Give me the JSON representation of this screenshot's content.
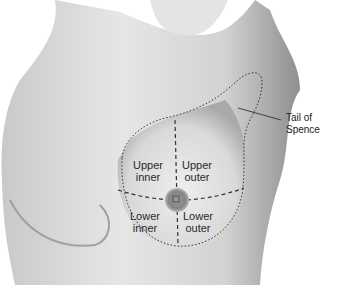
{
  "diagram": {
    "quadrants": [
      {
        "id": "upper-inner",
        "line1": "Upper",
        "line2": "inner"
      },
      {
        "id": "upper-outer",
        "line1": "Upper",
        "line2": "outer"
      },
      {
        "id": "lower-inner",
        "line1": "Lower",
        "line2": "inner"
      },
      {
        "id": "lower-outer",
        "line1": "Lower",
        "line2": "outer"
      }
    ],
    "callout": {
      "line1": "Tail of",
      "line2": "Spence"
    },
    "colors": {
      "skin_light": "#e8e8e8",
      "skin_mid": "#bdbdbd",
      "skin_dark": "#7a7a7a",
      "line": "#333333"
    }
  }
}
